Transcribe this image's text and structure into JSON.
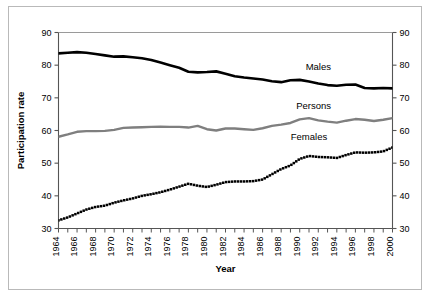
{
  "chart_data": {
    "type": "line",
    "title": "",
    "xlabel": "Year",
    "ylabel": "Participation rate",
    "xlim": [
      1964,
      2000
    ],
    "ylim": [
      30,
      90
    ],
    "grid": false,
    "legend_position": "inline-right",
    "y_ticks": [
      30,
      40,
      50,
      60,
      70,
      80,
      90
    ],
    "y_ticks_right": [
      30,
      40,
      50,
      60,
      70,
      80,
      90
    ],
    "x_ticks_labeled": [
      1964,
      1966,
      1968,
      1970,
      1972,
      1974,
      1976,
      1978,
      1980,
      1982,
      1984,
      1986,
      1988,
      1990,
      1992,
      1994,
      1996,
      1998,
      2000
    ],
    "x": [
      1964,
      1965,
      1966,
      1967,
      1968,
      1969,
      1970,
      1971,
      1972,
      1973,
      1974,
      1975,
      1976,
      1977,
      1978,
      1979,
      1980,
      1981,
      1982,
      1983,
      1984,
      1985,
      1986,
      1987,
      1988,
      1989,
      1990,
      1991,
      1992,
      1993,
      1994,
      1995,
      1996,
      1997,
      1998,
      1999,
      2000
    ],
    "series": [
      {
        "name": "Males",
        "color": "#000000",
        "style": "solid",
        "values": [
          83.6,
          83.8,
          84.0,
          83.8,
          83.4,
          83.0,
          82.6,
          82.7,
          82.4,
          82.1,
          81.6,
          80.8,
          80.0,
          79.2,
          78.0,
          77.8,
          77.9,
          78.1,
          77.4,
          76.6,
          76.2,
          75.9,
          75.6,
          75.1,
          74.8,
          75.4,
          75.5,
          75.0,
          74.4,
          73.9,
          73.7,
          74.0,
          74.1,
          73.0,
          72.9,
          73.0,
          72.9
        ]
      },
      {
        "name": "Persons",
        "color": "#7f7f7f",
        "style": "solid",
        "values": [
          58.1,
          58.8,
          59.6,
          59.8,
          59.8,
          59.9,
          60.2,
          60.8,
          60.9,
          61.0,
          61.1,
          61.2,
          61.1,
          61.1,
          60.9,
          61.4,
          60.4,
          60.0,
          60.6,
          60.6,
          60.4,
          60.2,
          60.7,
          61.4,
          61.8,
          62.3,
          63.4,
          63.8,
          63.1,
          62.7,
          62.4,
          63.0,
          63.5,
          63.3,
          62.9,
          63.3,
          63.8
        ]
      },
      {
        "name": "Females",
        "color": "#000000",
        "style": "dotted",
        "values": [
          32.5,
          33.4,
          34.6,
          35.8,
          36.6,
          37.0,
          37.9,
          38.6,
          39.2,
          40.0,
          40.5,
          41.1,
          41.9,
          42.8,
          43.7,
          43.1,
          42.7,
          43.4,
          44.2,
          44.4,
          44.4,
          44.5,
          45.0,
          46.6,
          48.2,
          49.3,
          51.3,
          52.2,
          51.9,
          51.8,
          51.6,
          52.5,
          53.3,
          53.2,
          53.3,
          53.6,
          54.8
        ]
      }
    ],
    "series_labels": [
      {
        "text": "Males",
        "x": 1992.0,
        "y": 78.5
      },
      {
        "text": "Persons",
        "x": 1991.5,
        "y": 66.5
      },
      {
        "text": "Females",
        "x": 1991.0,
        "y": 57.0
      }
    ]
  }
}
